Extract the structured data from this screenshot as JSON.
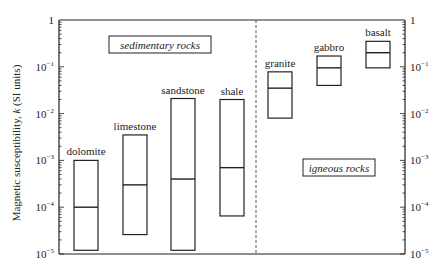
{
  "chart_data": {
    "type": "box",
    "title": "",
    "xlabel": "",
    "ylabel": "Magnetic susceptibility, k (SI units)",
    "yscale": "log",
    "ylim": [
      1e-05,
      1
    ],
    "y_ticks": [
      {
        "value": 1,
        "label": "1"
      },
      {
        "value": 0.1,
        "label": "10",
        "exp": "-1"
      },
      {
        "value": 0.01,
        "label": "10",
        "exp": "-2"
      },
      {
        "value": 0.001,
        "label": "10",
        "exp": "-3"
      },
      {
        "value": 0.0001,
        "label": "10",
        "exp": "-4"
      },
      {
        "value": 1e-05,
        "label": "10",
        "exp": "-5"
      }
    ],
    "grid": false,
    "legend": null,
    "groups": [
      {
        "name": "sedimentary rocks",
        "categories": [
          "dolomite",
          "limestone",
          "sandstone",
          "shale"
        ]
      },
      {
        "name": "igneous rocks",
        "categories": [
          "granite",
          "gabbro",
          "basalt"
        ]
      }
    ],
    "categories": [
      "dolomite",
      "limestone",
      "sandstone",
      "shale",
      "granite",
      "gabbro",
      "basalt"
    ],
    "series": [
      {
        "name": "min",
        "values": [
          1.2e-05,
          2.6e-05,
          1.2e-05,
          6.5e-05,
          0.008,
          0.04,
          0.095
        ]
      },
      {
        "name": "median",
        "values": [
          0.0001,
          0.0003,
          0.0004,
          0.0007,
          0.035,
          0.095,
          0.2
        ]
      },
      {
        "name": "max",
        "values": [
          0.001,
          0.0035,
          0.021,
          0.02,
          0.078,
          0.17,
          0.35
        ]
      }
    ]
  },
  "labels": {
    "ylabel_pre": "Magnetic susceptibility, ",
    "ylabel_k": "k",
    "ylabel_post": " (SI units)",
    "sedimentary": "sedimentary rocks",
    "igneous": "igneous rocks"
  }
}
